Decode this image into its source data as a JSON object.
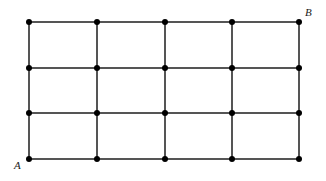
{
  "figure": {
    "type": "lattice-grid-diagram",
    "caption": "",
    "width": 326,
    "height": 181,
    "background_color": "#ffffff"
  },
  "graph": {
    "columns": 5,
    "rows": 4,
    "cell_columns": 4,
    "cell_rows": 3,
    "vertex_count": 20,
    "edge_color": "#555555",
    "edge_width": 1.2,
    "vertex_color": "#000000",
    "vertex_radius": 3,
    "x_positions": [
      29,
      97,
      165,
      232,
      299
    ],
    "y_positions": [
      22,
      68,
      113,
      159
    ]
  },
  "labels": [
    {
      "id": "label-a",
      "text": "A",
      "vertex": "bottom-left",
      "x": 14,
      "y": 160,
      "style": "italic-serif",
      "color": "#1a1a1a"
    },
    {
      "id": "label-b",
      "text": "B",
      "vertex": "top-right",
      "x": 305,
      "y": 7,
      "style": "italic-serif",
      "color": "#1a1a1a"
    }
  ],
  "chart_data": {
    "type": "scatter",
    "title": "",
    "xlabel": "",
    "ylabel": "",
    "grid": true,
    "legend": "none",
    "xlim": [
      0,
      4
    ],
    "ylim": [
      0,
      3
    ],
    "x": [
      0,
      1,
      2,
      3,
      4,
      0,
      1,
      2,
      3,
      4,
      0,
      1,
      2,
      3,
      4,
      0,
      1,
      2,
      3,
      4
    ],
    "y": [
      3,
      3,
      3,
      3,
      3,
      2,
      2,
      2,
      2,
      2,
      1,
      1,
      1,
      1,
      1,
      0,
      0,
      0,
      0,
      0
    ],
    "annotations": [
      {
        "text": "A",
        "x": 0,
        "y": 0
      },
      {
        "text": "B",
        "x": 4,
        "y": 3
      }
    ]
  }
}
